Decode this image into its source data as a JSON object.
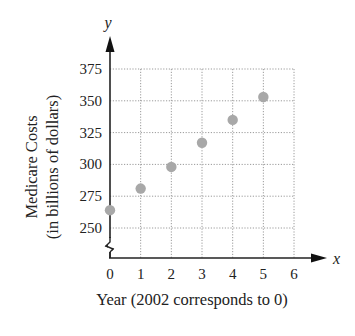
{
  "chart_data": {
    "type": "scatter",
    "title": "",
    "xlabel": "Year (2002 corresponds to 0)",
    "ylabel_line1": "Medicare Costs",
    "ylabel_line2": "(in billions of dollars)",
    "x_axis_var": "x",
    "y_axis_var": "y",
    "x_ticks": [
      "0",
      "1",
      "2",
      "3",
      "4",
      "5",
      "6"
    ],
    "y_ticks": [
      "250",
      "275",
      "300",
      "325",
      "350",
      "375"
    ],
    "xlim": [
      0,
      6
    ],
    "ylim": [
      250,
      375
    ],
    "y_axis_break": true,
    "grid": true,
    "grid_style": "dotted",
    "point_color": "#a8a8a8",
    "points": [
      {
        "x": 0,
        "y": 264
      },
      {
        "x": 1,
        "y": 281
      },
      {
        "x": 2,
        "y": 298
      },
      {
        "x": 3,
        "y": 317
      },
      {
        "x": 4,
        "y": 335
      },
      {
        "x": 5,
        "y": 353
      }
    ]
  }
}
